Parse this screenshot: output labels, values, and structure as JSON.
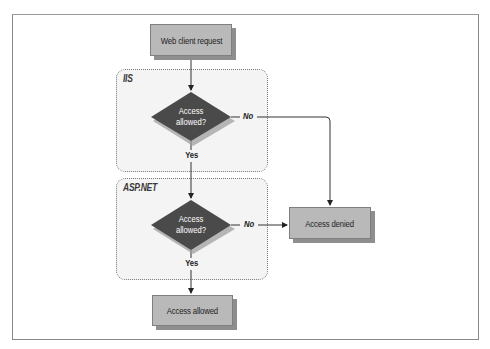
{
  "diagram": {
    "nodes": {
      "start": {
        "label": "Web client request",
        "shape": "rectangle"
      },
      "iis_decision": {
        "label_line1": "Access",
        "label_line2": "allowed?",
        "shape": "diamond"
      },
      "aspnet_decision": {
        "label_line1": "Access",
        "label_line2": "allowed?",
        "shape": "diamond"
      },
      "denied": {
        "label": "Access denied",
        "shape": "rectangle"
      },
      "allowed": {
        "label": "Access allowed",
        "shape": "rectangle"
      }
    },
    "regions": {
      "iis": {
        "label": "IIS"
      },
      "aspnet": {
        "label": "ASP.NET"
      }
    },
    "edges": [
      {
        "from": "start",
        "to": "iis_decision",
        "label": ""
      },
      {
        "from": "iis_decision",
        "to": "denied",
        "label": "No"
      },
      {
        "from": "iis_decision",
        "to": "aspnet_decision",
        "label": "Yes"
      },
      {
        "from": "aspnet_decision",
        "to": "denied",
        "label": "No"
      },
      {
        "from": "aspnet_decision",
        "to": "allowed",
        "label": "Yes"
      }
    ],
    "edge_labels": {
      "iis_no": "No",
      "iis_yes": "Yes",
      "aspnet_no": "No",
      "aspnet_yes": "Yes"
    },
    "colors": {
      "box_fill": "#b9b9b9",
      "box_shadow": "#8e8e8e",
      "diamond_fill": "#4a4a4a",
      "region_fill": "#f4f4f4",
      "line": "#333333"
    }
  }
}
